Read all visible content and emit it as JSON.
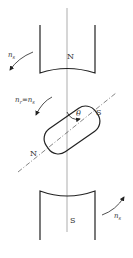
{
  "diagram": {
    "stator_top_pole": {
      "label": "N"
    },
    "stator_bottom_pole": {
      "label": "S"
    },
    "rotor": {
      "label_north": "N",
      "label_south": "S"
    },
    "angle": {
      "symbol": "θ"
    },
    "speed_labels": {
      "top_left": {
        "symbol": "n",
        "subscript": "s"
      },
      "rotor": {
        "lhs_symbol": "n",
        "lhs_subscript": "r",
        "equals": "=",
        "rhs_symbol": "n",
        "rhs_subscript": "s"
      },
      "bottom_right": {
        "symbol": "n",
        "subscript": "s"
      }
    },
    "colors": {
      "stroke": "#222222",
      "text": "#333333",
      "background": "#ffffff"
    }
  }
}
